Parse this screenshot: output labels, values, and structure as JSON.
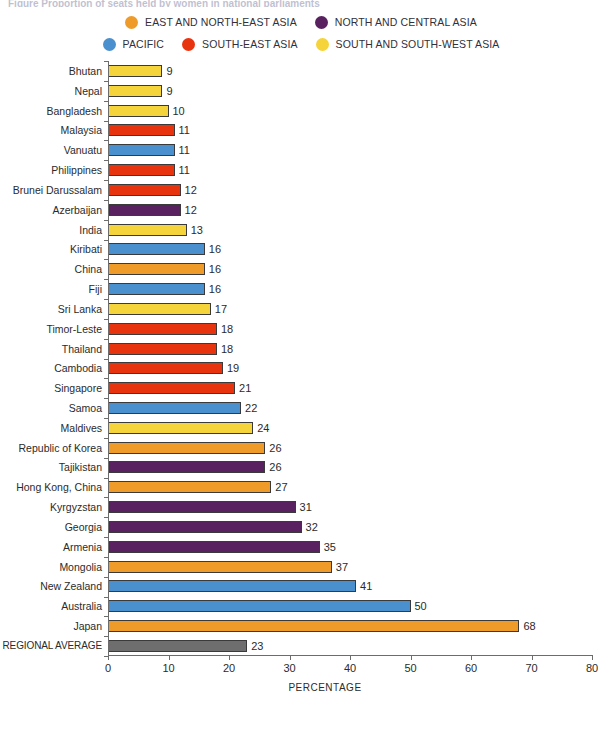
{
  "title_sliver": "Figure   Proportion of seats held by women in national parliaments",
  "legend": {
    "rows": [
      [
        {
          "label": "EAST AND NORTH-EAST ASIA",
          "color": "#EF9B2A",
          "key": "east-and-north-east-asia"
        },
        {
          "label": "NORTH AND CENTRAL ASIA",
          "color": "#5A2160",
          "key": "north-and-central-asia"
        }
      ],
      [
        {
          "label": "PACIFIC",
          "color": "#4A90CE",
          "key": "pacific"
        },
        {
          "label": "SOUTH-EAST ASIA",
          "color": "#E8330F",
          "key": "south-east-asia"
        },
        {
          "label": "SOUTH AND SOUTH-WEST ASIA",
          "color": "#F5D33A",
          "key": "south-and-south-west-asia"
        }
      ]
    ]
  },
  "colors": {
    "east_and_north_east_asia": "#EF9B2A",
    "north_and_central_asia": "#5A2160",
    "pacific": "#4A90CE",
    "south_east_asia": "#E8330F",
    "south_and_south_west_asia": "#F5D33A",
    "regional_average": "#6E6E6E",
    "axis": "#6C6C6C",
    "text": "#2B2B2B"
  },
  "chart_data": {
    "type": "bar",
    "orientation": "horizontal",
    "title": "",
    "subtitle": "",
    "xlabel": "PERCENTAGE",
    "ylabel": "",
    "xlim": [
      0,
      80
    ],
    "xticks": [
      0,
      10,
      20,
      30,
      40,
      50,
      60,
      70,
      80
    ],
    "grid": false,
    "legend_position": "top-center",
    "categories": [
      "Bhutan",
      "Nepal",
      "Bangladesh",
      "Malaysia",
      "Vanuatu",
      "Philippines",
      "Brunei Darussalam",
      "Azerbaijan",
      "India",
      "Kiribati",
      "China",
      "Fiji",
      "Sri Lanka",
      "Timor-Leste",
      "Thailand",
      "Cambodia",
      "Singapore",
      "Samoa",
      "Maldives",
      "Republic of Korea",
      "Tajikistan",
      "Hong Kong, China",
      "Kyrgyzstan",
      "Georgia",
      "Armenia",
      "Mongolia",
      "New Zealand",
      "Australia",
      "Japan",
      "REGIONAL AVERAGE"
    ],
    "values": [
      9,
      9,
      10,
      11,
      11,
      11,
      12,
      12,
      13,
      16,
      16,
      16,
      17,
      18,
      18,
      19,
      21,
      22,
      24,
      26,
      26,
      27,
      31,
      32,
      35,
      37,
      41,
      50,
      68,
      23
    ],
    "groups": [
      "south_and_south_west_asia",
      "south_and_south_west_asia",
      "south_and_south_west_asia",
      "south_east_asia",
      "pacific",
      "south_east_asia",
      "south_east_asia",
      "north_and_central_asia",
      "south_and_south_west_asia",
      "pacific",
      "east_and_north_east_asia",
      "pacific",
      "south_and_south_west_asia",
      "south_east_asia",
      "south_east_asia",
      "south_east_asia",
      "south_east_asia",
      "pacific",
      "south_and_south_west_asia",
      "east_and_north_east_asia",
      "north_and_central_asia",
      "east_and_north_east_asia",
      "north_and_central_asia",
      "north_and_central_asia",
      "north_and_central_asia",
      "east_and_north_east_asia",
      "pacific",
      "pacific",
      "east_and_north_east_asia",
      "regional_average"
    ],
    "bars": [
      {
        "label": "Bhutan",
        "value": 9,
        "group": "south_and_south_west_asia"
      },
      {
        "label": "Nepal",
        "value": 9,
        "group": "south_and_south_west_asia"
      },
      {
        "label": "Bangladesh",
        "value": 10,
        "group": "south_and_south_west_asia"
      },
      {
        "label": "Malaysia",
        "value": 11,
        "group": "south_east_asia"
      },
      {
        "label": "Vanuatu",
        "value": 11,
        "group": "pacific"
      },
      {
        "label": "Philippines",
        "value": 11,
        "group": "south_east_asia"
      },
      {
        "label": "Brunei Darussalam",
        "value": 12,
        "group": "south_east_asia"
      },
      {
        "label": "Azerbaijan",
        "value": 12,
        "group": "north_and_central_asia"
      },
      {
        "label": "India",
        "value": 13,
        "group": "south_and_south_west_asia"
      },
      {
        "label": "Kiribati",
        "value": 16,
        "group": "pacific"
      },
      {
        "label": "China",
        "value": 16,
        "group": "east_and_north_east_asia"
      },
      {
        "label": "Fiji",
        "value": 16,
        "group": "pacific"
      },
      {
        "label": "Sri Lanka",
        "value": 17,
        "group": "south_and_south_west_asia"
      },
      {
        "label": "Timor-Leste",
        "value": 18,
        "group": "south_east_asia"
      },
      {
        "label": "Thailand",
        "value": 18,
        "group": "south_east_asia"
      },
      {
        "label": "Cambodia",
        "value": 19,
        "group": "south_east_asia"
      },
      {
        "label": "Singapore",
        "value": 21,
        "group": "south_east_asia"
      },
      {
        "label": "Samoa",
        "value": 22,
        "group": "pacific"
      },
      {
        "label": "Maldives",
        "value": 24,
        "group": "south_and_south_west_asia"
      },
      {
        "label": "Republic of Korea",
        "value": 26,
        "group": "east_and_north_east_asia"
      },
      {
        "label": "Tajikistan",
        "value": 26,
        "group": "north_and_central_asia"
      },
      {
        "label": "Hong Kong, China",
        "value": 27,
        "group": "east_and_north_east_asia"
      },
      {
        "label": "Kyrgyzstan",
        "value": 31,
        "group": "north_and_central_asia"
      },
      {
        "label": "Georgia",
        "value": 32,
        "group": "north_and_central_asia"
      },
      {
        "label": "Armenia",
        "value": 35,
        "group": "north_and_central_asia"
      },
      {
        "label": "Mongolia",
        "value": 37,
        "group": "east_and_north_east_asia"
      },
      {
        "label": "New Zealand",
        "value": 41,
        "group": "pacific"
      },
      {
        "label": "Australia",
        "value": 50,
        "group": "pacific"
      },
      {
        "label": "Japan",
        "value": 68,
        "group": "east_and_north_east_asia"
      },
      {
        "label": "REGIONAL AVERAGE",
        "value": 23,
        "group": "regional_average"
      }
    ]
  }
}
